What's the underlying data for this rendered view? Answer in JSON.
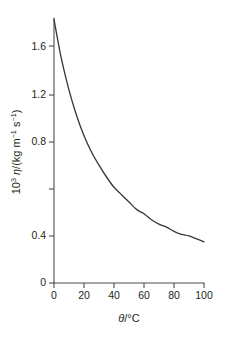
{
  "figure": {
    "background_color": "#ffffff",
    "curve_color": "#3a3a3a",
    "axis_color": "#4d4d4d",
    "text_color": "#231f20"
  },
  "axes": {
    "x": {
      "title_parts": {
        "symbol": "θ",
        "slash": "/",
        "unit": "°C"
      },
      "title": "θ/°C",
      "ticks": [
        "0",
        "20",
        "40",
        "60",
        "80",
        "100"
      ],
      "min": 0,
      "max": 100
    },
    "y": {
      "title_parts": {
        "factor_base": "10",
        "factor_exp": "3",
        "symbol": "η",
        "slash": "/(kg m",
        "exp1": "−1",
        "space": " s",
        "exp2": "−1",
        "close": ")"
      },
      "title": "10³ η/(kg m⁻¹ s⁻¹)",
      "ticks": [
        "0",
        "0.4",
        "0.8",
        "1.2",
        "1.6"
      ],
      "min": 0,
      "max": 1.8
    }
  },
  "chart_data": {
    "type": "line",
    "title": "",
    "subtitle": "",
    "xlabel": "θ/°C",
    "ylabel": "10³ η/(kg m⁻¹ s⁻¹)",
    "xlim": [
      0,
      100
    ],
    "ylim": [
      0,
      1.8
    ],
    "xticks": [
      0,
      20,
      40,
      60,
      80,
      100
    ],
    "yticks": [
      0,
      0.4,
      0.8,
      1.2,
      1.6
    ],
    "grid": false,
    "legend": null,
    "annotations": [],
    "series": [
      {
        "name": "viscosity of water",
        "x": [
          0,
          5,
          10,
          15,
          20,
          25,
          30,
          35,
          40,
          45,
          50,
          55,
          60,
          65,
          70,
          75,
          80,
          85,
          90,
          95,
          100
        ],
        "values": [
          1.79,
          1.52,
          1.31,
          1.14,
          1.0,
          0.89,
          0.8,
          0.72,
          0.65,
          0.6,
          0.55,
          0.5,
          0.47,
          0.43,
          0.4,
          0.38,
          0.35,
          0.33,
          0.32,
          0.3,
          0.28
        ]
      }
    ]
  }
}
